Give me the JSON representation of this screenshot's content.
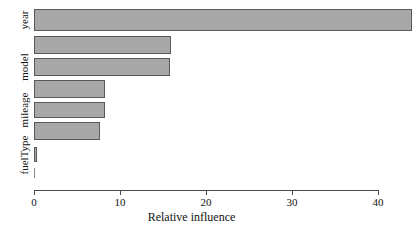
{
  "chart_data": {
    "type": "bar",
    "orientation": "horizontal",
    "title": "",
    "xlabel": "Relative influence",
    "ylabel": "",
    "xlim": [
      0,
      40
    ],
    "xticks": [
      0,
      10,
      20,
      30,
      40
    ],
    "xtick_labels": [
      "0",
      "10",
      "20",
      "30",
      "40"
    ],
    "grid": false,
    "legend": false,
    "categories": [
      "year",
      "",
      "model",
      "",
      "mileage",
      "",
      "fuelType",
      ""
    ],
    "visible_category_labels": [
      "year",
      "model",
      "mileage",
      "fuelType"
    ],
    "values": [
      43.9,
      15.9,
      15.8,
      8.3,
      8.2,
      7.7,
      0.35,
      0.0
    ],
    "bar_fill_color": "#a8a8a8",
    "bar_border_color": "#5a5a5a",
    "axis_color": "#4a4a4a",
    "background_color": "#ffffff"
  },
  "axis": {
    "x_title": "Relative influence",
    "ticks": [
      {
        "label": "0",
        "value": 0
      },
      {
        "label": "10",
        "value": 10
      },
      {
        "label": "20",
        "value": 20
      },
      {
        "label": "30",
        "value": 30
      },
      {
        "label": "40",
        "value": 40
      }
    ]
  },
  "y_labels": [
    {
      "text": "year",
      "at_bar": 0
    },
    {
      "text": "model",
      "at_bar": 2
    },
    {
      "text": "mileage",
      "at_bar": 4
    },
    {
      "text": "fuelType",
      "at_bar": 6
    }
  ],
  "bars": [
    {
      "name": "year",
      "value": 43.9
    },
    {
      "name": "bar-2",
      "value": 15.9
    },
    {
      "name": "model",
      "value": 15.8
    },
    {
      "name": "bar-4",
      "value": 8.3
    },
    {
      "name": "mileage",
      "value": 8.2
    },
    {
      "name": "bar-6",
      "value": 7.7
    },
    {
      "name": "fuelType",
      "value": 0.35
    },
    {
      "name": "bar-8",
      "value": 0.0
    }
  ]
}
